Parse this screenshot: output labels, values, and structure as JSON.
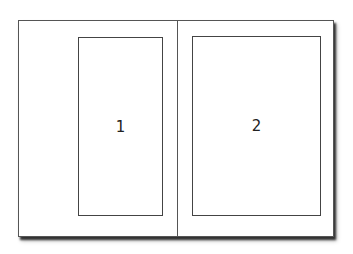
{
  "diagram": {
    "frames": [
      {
        "id": "frame-1",
        "label": "1",
        "page": "left"
      },
      {
        "id": "frame-2",
        "label": "2",
        "page": "right"
      }
    ],
    "colors": {
      "stroke": "#444444",
      "background": "#ffffff",
      "shadow": "#333333"
    }
  }
}
